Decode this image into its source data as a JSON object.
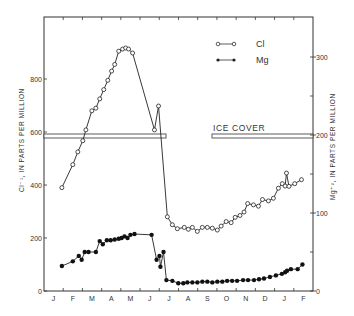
{
  "chart_data": {
    "type": "line",
    "title": "",
    "xlabel": "",
    "x_tick_labels": [
      "J",
      "F",
      "M",
      "A",
      "M",
      "J",
      "J",
      "A",
      "S",
      "O",
      "N",
      "D",
      "J",
      "F"
    ],
    "left_axis": {
      "label": "Cl⁻¹, IN PARTS PER MILLION",
      "ticks": [
        0,
        200,
        400,
        600,
        800
      ],
      "ylim": [
        0,
        1030
      ]
    },
    "right_axis": {
      "label": "Mg⁺², IN PARTS PER MILLION",
      "ticks": [
        0,
        100,
        200,
        300
      ],
      "minor_ticks": [
        50,
        150,
        250
      ],
      "ylim": [
        0,
        350
      ]
    },
    "legend": [
      {
        "name": "Cl",
        "marker": "open-circle"
      },
      {
        "name": "Mg",
        "marker": "filled-circle"
      }
    ],
    "annotations": [
      {
        "text": "ICE COVER",
        "type": "horizontal-bar",
        "periods": [
          [
            "Jan",
            "mid-Jun"
          ],
          [
            "early-Sep",
            "Feb"
          ]
        ],
        "level_left_axis": 595
      }
    ],
    "series": [
      {
        "name": "Cl",
        "axis": "left",
        "x_month": [
          0.93,
          1.5,
          1.76,
          2.02,
          2.18,
          2.49,
          2.7,
          2.9,
          3.11,
          3.32,
          3.52,
          3.68,
          3.89,
          4.09,
          4.25,
          4.4,
          4.61,
          5.75,
          5.96,
          6.42,
          6.68,
          6.94,
          7.3,
          7.51,
          7.72,
          7.98,
          8.24,
          8.5,
          8.76,
          9.02,
          9.22,
          9.48,
          9.74,
          9.95,
          10.2,
          10.41,
          10.6,
          10.9,
          11.16,
          11.37,
          11.68,
          11.94,
          12.2,
          12.4,
          12.55,
          12.62,
          12.75,
          13.05,
          13.4
        ],
        "values": [
          390,
          477,
          525,
          567,
          608,
          680,
          690,
          725,
          760,
          795,
          830,
          855,
          905,
          913,
          917,
          913,
          898,
          608,
          698,
          280,
          250,
          235,
          240,
          233,
          240,
          225,
          240,
          240,
          237,
          230,
          245,
          262,
          258,
          278,
          285,
          298,
          330,
          325,
          320,
          345,
          340,
          350,
          388,
          405,
          396,
          445,
          395,
          405,
          420
        ]
      },
      {
        "name": "Mg",
        "axis": "right",
        "x_month": [
          0.93,
          1.5,
          1.81,
          1.96,
          2.12,
          2.32,
          2.7,
          2.9,
          3.06,
          3.27,
          3.47,
          3.68,
          3.89,
          4.04,
          4.19,
          4.35,
          4.5,
          4.71,
          5.6,
          5.86,
          6.01,
          6.06,
          6.22,
          6.37,
          6.68,
          6.99,
          7.25,
          7.46,
          7.72,
          7.98,
          8.24,
          8.5,
          8.76,
          9.02,
          9.28,
          9.53,
          9.79,
          10.05,
          10.36,
          10.62,
          10.93,
          11.19,
          11.45,
          11.76,
          12.07,
          12.38,
          12.55,
          12.65,
          12.85,
          13.2,
          13.45
        ],
        "values": [
          32,
          38,
          45,
          40,
          50,
          50,
          50,
          64,
          60,
          65,
          65,
          66,
          67,
          68,
          70,
          68,
          72,
          73,
          72,
          40,
          45,
          31,
          50,
          14,
          13,
          10,
          10,
          11,
          11,
          11,
          12,
          12,
          11,
          12,
          12,
          13,
          13,
          13,
          14,
          14,
          14,
          15,
          16,
          18,
          20,
          22,
          24,
          26,
          28,
          28,
          34
        ]
      }
    ]
  }
}
